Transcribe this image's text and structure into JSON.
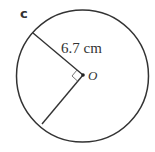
{
  "diagram": {
    "part_label": "c",
    "radius_label": "6.7 cm",
    "center_label": "O",
    "colors": {
      "stroke": "#333333",
      "background": "#ffffff"
    }
  }
}
